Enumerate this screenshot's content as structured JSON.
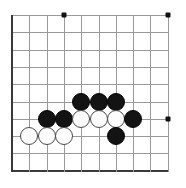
{
  "figure": {
    "width": 186,
    "height": 188,
    "background_color": "#ffffff"
  },
  "board": {
    "type": "go-board-section",
    "columns": 10,
    "rows": 10,
    "origin_x": 12,
    "origin_y": 15,
    "spacing": 17.3,
    "line_color": "#9a9a9a",
    "border_color": "#3a3a3a",
    "border_edges": [
      "left",
      "bottom"
    ],
    "stone_radius": 9,
    "star_point_color": "#111111",
    "black_stone_color": "#131313",
    "white_stone_color": "#fdfdfd",
    "white_stone_outline": "#4a4a4a"
  },
  "star_points": [
    {
      "col": 3,
      "row": 0
    },
    {
      "col": 9,
      "row": 0
    },
    {
      "col": 9,
      "row": 6
    }
  ],
  "stones": [
    {
      "color": "black",
      "col": 4,
      "row": 5
    },
    {
      "color": "black",
      "col": 5,
      "row": 5
    },
    {
      "color": "black",
      "col": 6,
      "row": 5
    },
    {
      "color": "black",
      "col": 2,
      "row": 6
    },
    {
      "color": "black",
      "col": 3,
      "row": 6
    },
    {
      "color": "white",
      "col": 4,
      "row": 6
    },
    {
      "color": "white",
      "col": 5,
      "row": 6
    },
    {
      "color": "white",
      "col": 6,
      "row": 6
    },
    {
      "color": "black",
      "col": 7,
      "row": 6
    },
    {
      "color": "white",
      "col": 1,
      "row": 7
    },
    {
      "color": "white",
      "col": 2,
      "row": 7
    },
    {
      "color": "white",
      "col": 3,
      "row": 7
    },
    {
      "color": "black",
      "col": 6,
      "row": 7
    }
  ],
  "counts": {
    "black_stones": 7,
    "white_stones": 6,
    "total_stones": 13
  }
}
